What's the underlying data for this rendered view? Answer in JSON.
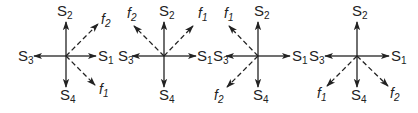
{
  "figure": {
    "colors": {
      "line": "#222222",
      "background": "#ffffff"
    },
    "panels": [
      {
        "id": "panel-1",
        "center": [
          66,
          56
        ],
        "axes": {
          "S1": "right",
          "S2": "up",
          "S3": "left",
          "S4": "down"
        },
        "dashed": [
          {
            "name": "f2",
            "direction": "up-right"
          },
          {
            "name": "f1",
            "direction": "down-right"
          }
        ],
        "labels": {
          "S1": {
            "base": "S",
            "sub": "1"
          },
          "S2": {
            "base": "S",
            "sub": "2"
          },
          "S3": {
            "base": "S",
            "sub": "3"
          },
          "S4": {
            "base": "S",
            "sub": "4"
          },
          "f1": {
            "base": "f",
            "sub": "1"
          },
          "f2": {
            "base": "f",
            "sub": "2"
          }
        }
      },
      {
        "id": "panel-2",
        "center": [
          164,
          56
        ],
        "axes": {
          "S1": "right",
          "S2": "up",
          "S3": "left",
          "S4": "down"
        },
        "dashed": [
          {
            "name": "f2",
            "direction": "up-left"
          },
          {
            "name": "f1",
            "direction": "up-right"
          }
        ],
        "labels": {
          "S1": {
            "base": "S",
            "sub": "1"
          },
          "S2": {
            "base": "S",
            "sub": "2"
          },
          "S3": {
            "base": "S",
            "sub": "3"
          },
          "S4": {
            "base": "S",
            "sub": "4"
          },
          "f1": {
            "base": "f",
            "sub": "1"
          },
          "f2": {
            "base": "f",
            "sub": "2"
          }
        }
      },
      {
        "id": "panel-3",
        "center": [
          258,
          56
        ],
        "axes": {
          "S1": "right",
          "S2": "up",
          "S3": "left",
          "S4": "down"
        },
        "dashed": [
          {
            "name": "f1",
            "direction": "up-left"
          },
          {
            "name": "f2",
            "direction": "down-left"
          }
        ],
        "labels": {
          "S1": {
            "base": "S",
            "sub": "1"
          },
          "S2": {
            "base": "S",
            "sub": "2"
          },
          "S3": {
            "base": "S",
            "sub": "3"
          },
          "S4": {
            "base": "S",
            "sub": "4"
          },
          "f1": {
            "base": "f",
            "sub": "1"
          },
          "f2": {
            "base": "f",
            "sub": "2"
          }
        }
      },
      {
        "id": "panel-4",
        "center": [
          357,
          56
        ],
        "axes": {
          "S1": "right",
          "S2": "up",
          "S3": "left",
          "S4": "down"
        },
        "dashed": [
          {
            "name": "f1",
            "direction": "down-left"
          },
          {
            "name": "f2",
            "direction": "down-right"
          }
        ],
        "labels": {
          "S1": {
            "base": "S",
            "sub": "1"
          },
          "S2": {
            "base": "S",
            "sub": "2"
          },
          "S3": {
            "base": "S",
            "sub": "3"
          },
          "S4": {
            "base": "S",
            "sub": "4"
          },
          "f1": {
            "base": "f",
            "sub": "1"
          },
          "f2": {
            "base": "f",
            "sub": "2"
          }
        }
      }
    ]
  }
}
